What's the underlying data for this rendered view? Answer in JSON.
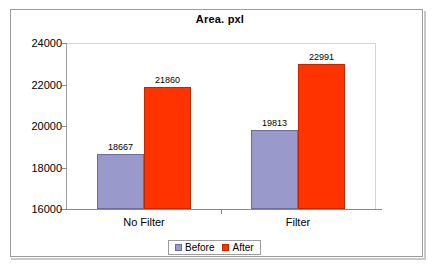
{
  "chart_data": {
    "type": "bar",
    "title": "Area. pxl",
    "xlabel": "",
    "ylabel": "",
    "categories": [
      "No Filter",
      "Filter"
    ],
    "series": [
      {
        "name": "Before",
        "values": [
          18667,
          19813
        ],
        "color": "#9999cc"
      },
      {
        "name": "After",
        "values": [
          21860,
          22991
        ],
        "color": "#ff3300"
      }
    ],
    "note_series_layout": "Each category shows the Before bar then the After bar side by side",
    "data_by_category": [
      {
        "category": "No Filter",
        "Before": 18667,
        "After": 19813
      },
      {
        "category": "Filter",
        "Before": 21860,
        "After": 22991
      }
    ],
    "ylim": [
      16000,
      24000
    ],
    "yticks": [
      16000,
      18000,
      20000,
      22000,
      24000
    ],
    "ytick_labels": [
      "16000",
      "18000",
      "20000",
      "22000",
      "24000"
    ],
    "grid": false,
    "legend_position": "bottom",
    "data_labels": [
      "18667",
      "19813",
      "21860",
      "22991"
    ]
  },
  "legend": {
    "items": [
      {
        "label": "Before",
        "swatch": "before"
      },
      {
        "label": "After",
        "swatch": "after"
      }
    ]
  }
}
